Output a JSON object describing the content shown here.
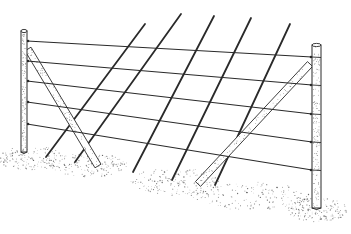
{
  "figure": {
    "title": "Fence with end posts, braces, wires and diagonal rods",
    "colors": {
      "ink": "#2a2a2a",
      "paper": "#ffffff",
      "stipple": "#555555"
    }
  },
  "posts": [
    {
      "name": "left-post",
      "x": 21,
      "top": 31,
      "bottom": 152,
      "width": 6
    },
    {
      "name": "right-post",
      "x": 312,
      "top": 45,
      "bottom": 208,
      "width": 9
    }
  ],
  "wires": [
    {
      "x1": 27,
      "y1": 41,
      "x2": 312,
      "y2": 57
    },
    {
      "x1": 27,
      "y1": 61,
      "x2": 312,
      "y2": 85
    },
    {
      "x1": 27,
      "y1": 81,
      "x2": 312,
      "y2": 114
    },
    {
      "x1": 27,
      "y1": 102,
      "x2": 312,
      "y2": 142
    },
    {
      "x1": 27,
      "y1": 124,
      "x2": 312,
      "y2": 170
    }
  ],
  "braces": [
    {
      "name": "left-brace",
      "x1": 28,
      "y1": 49,
      "x2": 98,
      "y2": 166,
      "width": 7
    },
    {
      "name": "right-brace",
      "x1": 310,
      "y1": 64,
      "x2": 198,
      "y2": 184,
      "width": 7
    }
  ],
  "rods": [
    {
      "x1": 46,
      "y1": 157,
      "x2": 145,
      "y2": 24
    },
    {
      "x1": 75,
      "y1": 162,
      "x2": 181,
      "y2": 14
    },
    {
      "x1": 133,
      "y1": 172,
      "x2": 214,
      "y2": 16
    },
    {
      "x1": 172,
      "y1": 180,
      "x2": 251,
      "y2": 18
    },
    {
      "x1": 215,
      "y1": 185,
      "x2": 290,
      "y2": 24
    }
  ],
  "ground_patches": [
    {
      "cx": 30,
      "cy": 158,
      "rx": 35,
      "ry": 12
    },
    {
      "cx": 90,
      "cy": 165,
      "rx": 40,
      "ry": 12
    },
    {
      "cx": 175,
      "cy": 182,
      "rx": 45,
      "ry": 14
    },
    {
      "cx": 318,
      "cy": 210,
      "rx": 30,
      "ry": 12
    },
    {
      "cx": 250,
      "cy": 196,
      "rx": 60,
      "ry": 14
    }
  ]
}
